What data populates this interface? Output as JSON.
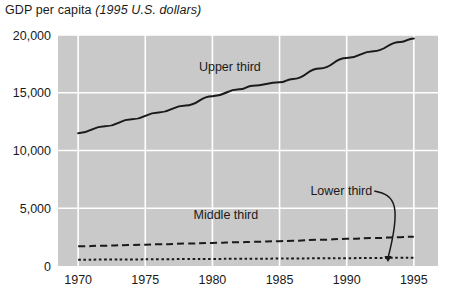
{
  "title": {
    "main": "GDP per capita",
    "units": "(1995 U.S. dollars)"
  },
  "colors": {
    "plot_background": "#c9c9c9",
    "gridline": "#ffffff",
    "line": "#1a1a1a",
    "text": "#1a1a1a",
    "page_background": "#ffffff"
  },
  "chart_data": {
    "type": "line",
    "title": "GDP per capita (1995 U.S. dollars)",
    "xlabel": "",
    "ylabel": "",
    "xlim": [
      1968.5,
      1996.8
    ],
    "ylim": [
      0,
      20000
    ],
    "xticks": [
      1970,
      1975,
      1980,
      1985,
      1990,
      1995
    ],
    "xticklabels": [
      "1970",
      "1975",
      "1980",
      "1985",
      "1990",
      "1995"
    ],
    "yticks": [
      0,
      5000,
      10000,
      15000,
      20000
    ],
    "yticklabels": [
      "0",
      "5,000",
      "10,000",
      "15,000",
      "20,000"
    ],
    "grid": true,
    "legend": "inline-annotations",
    "x": [
      1970,
      1972,
      1974,
      1976,
      1978,
      1980,
      1982,
      1983,
      1985,
      1986,
      1988,
      1990,
      1992,
      1994,
      1995
    ],
    "series": [
      {
        "name": "Upper third",
        "label": "Upper third",
        "style": "solid",
        "values": [
          11500,
          12100,
          12700,
          13300,
          13900,
          14700,
          15300,
          15600,
          15900,
          16200,
          17100,
          18000,
          18600,
          19400,
          19700
        ]
      },
      {
        "name": "Middle third",
        "label": "Middle third",
        "style": "dashed",
        "values": [
          1700,
          1760,
          1820,
          1880,
          1940,
          2000,
          2060,
          2090,
          2150,
          2190,
          2270,
          2350,
          2420,
          2500,
          2540
        ]
      },
      {
        "name": "Lower third",
        "label": "Lower third",
        "style": "dotted",
        "values": [
          540,
          555,
          570,
          585,
          600,
          615,
          625,
          630,
          640,
          650,
          665,
          680,
          695,
          715,
          725
        ]
      }
    ],
    "annotations": [
      {
        "text": "Upper third",
        "x": 1981.3,
        "y": 16900,
        "target_series": "Upper third"
      },
      {
        "text": "Middle third",
        "x": 1981.0,
        "y": 4100,
        "target_series": "Middle third"
      },
      {
        "text": "Lower third",
        "x": 1989.6,
        "y": 6150,
        "target_series": "Lower third",
        "has_leader_arrow": true
      }
    ]
  }
}
